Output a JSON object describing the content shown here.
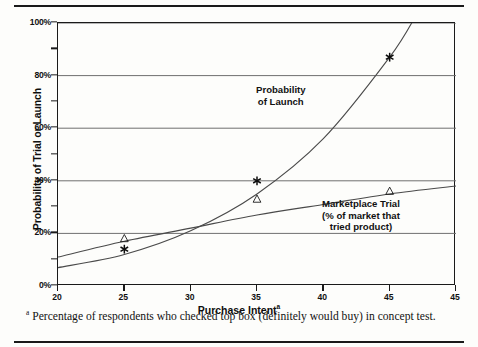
{
  "chart_data": {
    "type": "line",
    "title": "",
    "xlabel": "Purchase Intent",
    "xlabel_superscript": "a",
    "ylabel": "Probability of Trial or Launch",
    "xlim": [
      20,
      45
    ],
    "ylim": [
      0,
      100
    ],
    "grid": true,
    "legend_position": "inline-annotations",
    "x_ticks": [
      {
        "value": 20,
        "label": "20"
      },
      {
        "value": 25,
        "label": "25"
      },
      {
        "value": 30,
        "label": "30"
      },
      {
        "value": 35,
        "label": "35"
      },
      {
        "value": 40,
        "label": "40"
      },
      {
        "value": 45,
        "label": "45"
      },
      {
        "value": 50,
        "label": "45"
      }
    ],
    "y_ticks_major": [
      {
        "value": 0,
        "label": "0%"
      },
      {
        "value": 20,
        "label": "20%"
      },
      {
        "value": 40,
        "label": "40%"
      },
      {
        "value": 60,
        "label": "60%"
      },
      {
        "value": 80,
        "label": "80%"
      },
      {
        "value": 100,
        "label": "100%"
      }
    ],
    "y_ticks_minor": [
      10,
      30,
      50,
      70,
      90
    ],
    "series": [
      {
        "name": "Probability of Launch",
        "annotation": "Probability\nof Launch",
        "marker": "asterisk",
        "curve": [
          {
            "x": 20,
            "y": 7
          },
          {
            "x": 25,
            "y": 12
          },
          {
            "x": 30,
            "y": 21
          },
          {
            "x": 35,
            "y": 35
          },
          {
            "x": 40,
            "y": 56
          },
          {
            "x": 45,
            "y": 87
          },
          {
            "x": 47,
            "y": 103
          }
        ],
        "points": [
          {
            "x": 25,
            "y": 14
          },
          {
            "x": 35,
            "y": 40
          },
          {
            "x": 45,
            "y": 87
          }
        ]
      },
      {
        "name": "Marketplace Trial",
        "annotation": "Marketplace Trial\n(% of market that\ntried product)",
        "marker": "triangle",
        "curve": [
          {
            "x": 20,
            "y": 11
          },
          {
            "x": 25,
            "y": 17
          },
          {
            "x": 30,
            "y": 22
          },
          {
            "x": 35,
            "y": 27
          },
          {
            "x": 40,
            "y": 31
          },
          {
            "x": 45,
            "y": 35
          },
          {
            "x": 50,
            "y": 38
          }
        ],
        "points": [
          {
            "x": 25,
            "y": 18
          },
          {
            "x": 35,
            "y": 33
          },
          {
            "x": 45,
            "y": 36
          }
        ]
      }
    ]
  },
  "annotations": {
    "launch_line1": "Probability",
    "launch_line2": "of Launch",
    "trial_line1": "Marketplace Trial",
    "trial_line2": "(% of market that",
    "trial_line3": "tried product)"
  },
  "footnote": {
    "marker": "a",
    "text": "Percentage of respondents who checked top box (definitely would buy) in concept test."
  }
}
